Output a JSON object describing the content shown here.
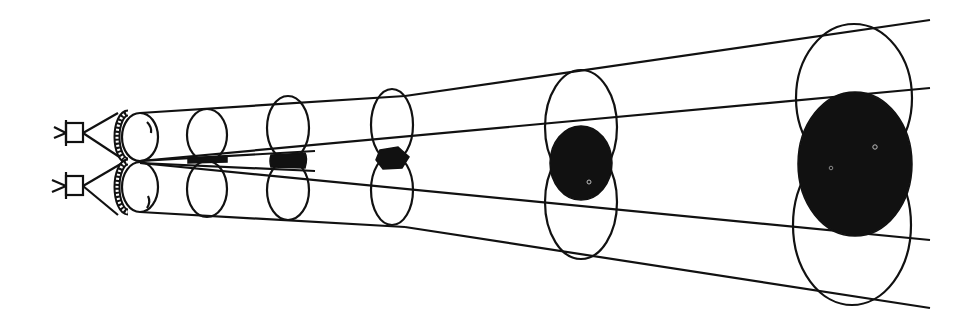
{
  "diagram": {
    "type": "stereoscopic-viewing-frustum",
    "colors": {
      "line": "#111111",
      "overlap": "#111111",
      "background": "#ffffff"
    },
    "cameras": [
      {
        "id": "camera-top",
        "x": 70,
        "y": 133
      },
      {
        "id": "camera-bottom",
        "x": 70,
        "y": 185
      }
    ],
    "lenses": [
      {
        "cx": 138,
        "cy": 137,
        "rx": 20,
        "ry": 24
      },
      {
        "cx": 138,
        "cy": 186,
        "rx": 20,
        "ry": 25
      }
    ],
    "sections": [
      {
        "x": 207,
        "top_cy": 135,
        "bot_cy": 190,
        "rx": 21,
        "ry_top": 27,
        "ry_bot": 29,
        "overlap": "sliver"
      },
      {
        "x": 290,
        "top_cy": 130,
        "bot_cy": 192,
        "rx": 22,
        "ry_top": 33,
        "ry_bot": 30,
        "overlap": "band"
      },
      {
        "x": 392,
        "top_cy": 126,
        "bot_cy": 192,
        "rx": 21,
        "ry_top": 36,
        "ry_bot": 33,
        "overlap": "small-lens"
      },
      {
        "x": 583,
        "top_cy": 127,
        "bot_cy": 203,
        "rx": 36,
        "ry_top": 57,
        "ry_bot": 57,
        "overlap": "disc"
      },
      {
        "x": 855,
        "top_cy": 98,
        "bot_cy": 225,
        "rx": 60,
        "ry_top": 73,
        "ry_bot": 82,
        "overlap": "large-disc"
      }
    ]
  }
}
